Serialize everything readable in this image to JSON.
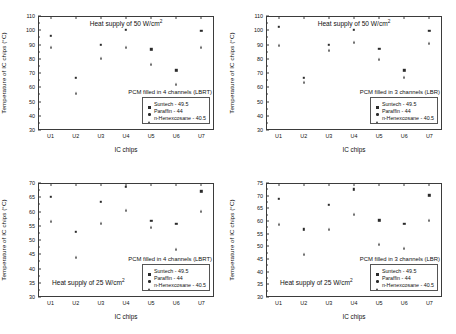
{
  "figure": {
    "xlabel": "IC chips",
    "ylabel": "Temperature of IC chips (°C)",
    "categories": [
      "U1",
      "U2",
      "U3",
      "U4",
      "U5",
      "U6",
      "U7"
    ],
    "series_names": [
      "Suntech - 49.5",
      "Paraffin - 44",
      "n-Henexcosane - 40.5"
    ]
  },
  "chart_data": [
    {
      "type": "scatter",
      "panel": "top-left",
      "title": "Heat supply of 50 W/cm",
      "title_sup": "2",
      "legend_title": "PCM filled in 4 channels (LBRT)",
      "legend_position": "bottom-right",
      "xlabel": "IC chips",
      "ylabel": "Temperature of IC chips (°C)",
      "categories": [
        "U1",
        "U2",
        "U3",
        "U4",
        "U5",
        "U6",
        "U7"
      ],
      "ylim": [
        30,
        110
      ],
      "yticks": [
        30,
        40,
        50,
        60,
        70,
        80,
        90,
        100,
        110
      ],
      "grid": false,
      "series": [
        {
          "name": "Suntech - 49.5",
          "marker": "square",
          "values": [
            96.0,
            66.5,
            89.8,
            100.2,
            86.5,
            72.0,
            99.5
          ]
        },
        {
          "name": "Paraffin - 44",
          "marker": "circle",
          "values": [
            91.5,
            59.0,
            84.0,
            95.5,
            81.8,
            68.2,
            95.0
          ]
        },
        {
          "name": "n-Henexcosane - 40.5",
          "marker": "triangle",
          "values": [
            88.2,
            55.8,
            80.5,
            88.2,
            76.2,
            62.5,
            88.5
          ]
        }
      ]
    },
    {
      "type": "scatter",
      "panel": "top-right",
      "title": "Heat supply of 50 W/cm",
      "title_sup": "2",
      "legend_title": "PCM filled in 3 channels (LBR)",
      "legend_position": "bottom-right",
      "xlabel": "IC chips",
      "ylabel": "Temperature of IC chips (°C)",
      "categories": [
        "U1",
        "U2",
        "U3",
        "U4",
        "U5",
        "U6",
        "U7"
      ],
      "ylim": [
        30,
        110
      ],
      "yticks": [
        30,
        40,
        50,
        60,
        70,
        80,
        90,
        100,
        110
      ],
      "grid": false,
      "series": [
        {
          "name": "Suntech - 49.5",
          "marker": "square",
          "values": [
            102.5,
            66.5,
            90.0,
            100.2,
            86.8,
            71.8,
            99.5
          ]
        },
        {
          "name": "Paraffin - 44",
          "marker": "circle",
          "values": [
            96.8,
            65.2,
            87.0,
            97.0,
            83.5,
            69.8,
            97.0
          ]
        },
        {
          "name": "n-Henexcosane - 40.5",
          "marker": "triangle",
          "values": [
            89.8,
            63.8,
            85.8,
            92.0,
            79.5,
            67.0,
            91.2
          ]
        }
      ]
    },
    {
      "type": "scatter",
      "panel": "bottom-left",
      "title": "",
      "heat_note": "Heat supply of 25 W/cm",
      "heat_note_sup": "2",
      "legend_title": "PCM filled in 4 channels (LBRT)",
      "legend_position": "bottom-right",
      "xlabel": "IC chips",
      "ylabel": "Temperature of IC chips (°C)",
      "categories": [
        "U1",
        "U2",
        "U3",
        "U4",
        "U5",
        "U6",
        "U7"
      ],
      "ylim": [
        30,
        70
      ],
      "yticks": [
        30,
        35,
        40,
        45,
        50,
        55,
        60,
        65,
        70
      ],
      "grid": false,
      "series": [
        {
          "name": "Suntech - 49.5",
          "marker": "square",
          "values": [
            65.1,
            52.8,
            63.3,
            68.6,
            56.7,
            55.6,
            67.1
          ]
        },
        {
          "name": "Paraffin - 44",
          "marker": "circle",
          "values": [
            58.1,
            45.2,
            56.7,
            62.0,
            55.2,
            48.2,
            61.6
          ]
        },
        {
          "name": "n-Henexcosane - 40.5",
          "marker": "triangle",
          "values": [
            56.8,
            44.2,
            56.0,
            60.7,
            54.6,
            46.8,
            60.2
          ]
        }
      ]
    },
    {
      "type": "scatter",
      "panel": "bottom-right",
      "title": "",
      "heat_note": "Heat supply of 25 W/cm",
      "heat_note_sup": "2",
      "legend_title": "PCM filled in 3 channels (LBR)",
      "legend_position": "bottom-right",
      "xlabel": "IC chips",
      "ylabel": "Temperature of IC chips (°C)",
      "categories": [
        "U1",
        "U2",
        "U3",
        "U4",
        "U5",
        "U6",
        "U7"
      ],
      "ylim": [
        30,
        75
      ],
      "yticks": [
        30,
        35,
        40,
        45,
        50,
        55,
        60,
        65,
        70,
        75
      ],
      "grid": false,
      "series": [
        {
          "name": "Suntech - 49.5",
          "marker": "square",
          "values": [
            68.8,
            56.7,
            66.4,
            72.5,
            60.2,
            58.8,
            70.2
          ]
        },
        {
          "name": "Paraffin - 44",
          "marker": "circle",
          "values": [
            65.2,
            52.5,
            62.2,
            68.4,
            56.2,
            54.2,
            66.0
          ]
        },
        {
          "name": "n-Henexcosane - 40.5",
          "marker": "triangle",
          "values": [
            59.0,
            47.0,
            56.7,
            62.8,
            50.8,
            49.2,
            60.5
          ]
        }
      ]
    }
  ],
  "caption": ""
}
